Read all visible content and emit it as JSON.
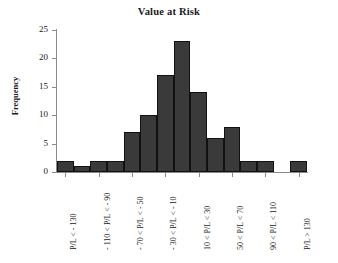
{
  "chart_data": {
    "type": "bar",
    "title": "Value at Risk",
    "xlabel": "",
    "ylabel": "Frequency",
    "ylim": [
      0,
      25
    ],
    "yticks": [
      0,
      5,
      10,
      15,
      20,
      25
    ],
    "grid": false,
    "legend": null,
    "bar_color": "#3a3a3a",
    "bar_edge_color": "#111111",
    "axis_color": "#8a8a8a",
    "categories": [
      "P/L < -130",
      "-130 < P/L < -110",
      "-110 < P/L < -90",
      "-90 < P/L < -70",
      "-70 < P/L < -50",
      "-50 < P/L < -30",
      "-30 < P/L < -10",
      "-10 < P/L < 10",
      "10 < P/L < 30",
      "30 < P/L < 50",
      "50 < P/L < 70",
      "70 < P/L < 90",
      "90 < P/L < 110",
      "110 < P/L < 130",
      "P/L > 130"
    ],
    "values": [
      2,
      1,
      2,
      2,
      7,
      10,
      17,
      23,
      14,
      6,
      8,
      2,
      2,
      0,
      2
    ],
    "visible_tick_labels": [
      "P/L < - 130",
      "- 110 < P/L < - 90",
      "- 70 < P/L < - 50",
      "- 30 < P/L < - 10",
      "10 < P/L < 30",
      "50 < P/L < 70",
      "90 < P/L < 110",
      "P/L > 130"
    ],
    "visible_tick_label_indices": [
      0,
      2,
      4,
      6,
      8,
      10,
      12,
      14
    ]
  },
  "caption": ""
}
